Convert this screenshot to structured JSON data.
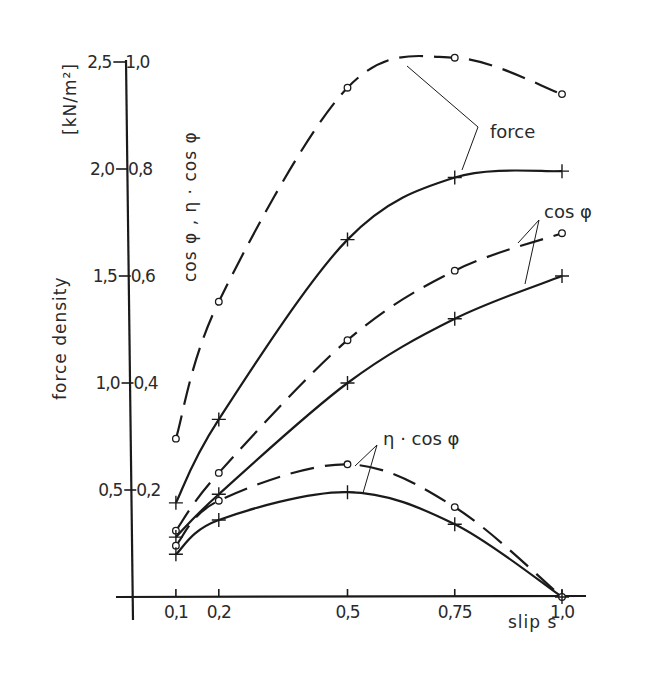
{
  "chart_data": {
    "type": "line",
    "title": "",
    "xlabel": "slip s",
    "ylabel_left": "force density",
    "ylabel_left_unit": "[kN/m²]",
    "ylabel_right": "cos φ , η·cos φ",
    "xlim": [
      0,
      1.05
    ],
    "ylim_left": [
      0,
      2.5
    ],
    "ylim_right": [
      0,
      1.0
    ],
    "grid": false,
    "legend": "inline annotations",
    "x_ticks": [
      "0,1",
      "0,2",
      "0,5",
      "0,75",
      "1,0"
    ],
    "x_tick_values": [
      0.1,
      0.2,
      0.5,
      0.75,
      1.0
    ],
    "y_ticks_left": [
      "0,5",
      "1,0",
      "1,5",
      "2,0",
      "2,5"
    ],
    "y_ticks_left_values": [
      0.5,
      1.0,
      1.5,
      2.0,
      2.5
    ],
    "y_ticks_right": [
      "0,2",
      "0,4",
      "0,6",
      "0,8",
      "1,0"
    ],
    "x": [
      0.1,
      0.2,
      0.5,
      0.75,
      1.0
    ],
    "series": [
      {
        "name": "force (dashed, o)",
        "axis": "left",
        "style": "dashed",
        "marker": "o",
        "values": [
          0.74,
          1.38,
          2.38,
          2.52,
          2.35
        ]
      },
      {
        "name": "force (solid, +)",
        "axis": "left",
        "style": "solid",
        "marker": "+",
        "values": [
          0.44,
          0.83,
          1.67,
          1.96,
          1.99
        ]
      },
      {
        "name": "cos φ (dashed, o)",
        "axis": "right",
        "style": "dashed",
        "marker": "o",
        "values": [
          0.124,
          0.232,
          0.48,
          0.61,
          0.68
        ]
      },
      {
        "name": "cos φ (solid, +)",
        "axis": "right",
        "style": "solid",
        "marker": "+",
        "values": [
          0.112,
          0.192,
          0.4,
          0.52,
          0.6
        ]
      },
      {
        "name": "η·cos φ (dashed, o)",
        "axis": "right",
        "style": "dashed",
        "marker": "o",
        "values": [
          0.096,
          0.18,
          0.248,
          0.168,
          0.0
        ]
      },
      {
        "name": "η·cos φ (solid, +)",
        "axis": "right",
        "style": "solid",
        "marker": "+",
        "values": [
          0.08,
          0.144,
          0.196,
          0.136,
          0.0
        ]
      }
    ],
    "annotations": [
      {
        "text": "force",
        "targets": [
          "force (dashed, o)",
          "force (solid, +)"
        ]
      },
      {
        "text": "cos φ",
        "targets": [
          "cos φ (dashed, o)",
          "cos φ (solid, +)"
        ]
      },
      {
        "text": "η · cos φ",
        "targets": [
          "η·cos φ (dashed, o)",
          "η·cos φ (solid, +)"
        ]
      }
    ]
  },
  "labels": {
    "ylabel_left": "force density",
    "ylabel_unit": "[kN/m²]",
    "ylabel_right": "cos φ , η · cos φ",
    "xlabel": "slip  s",
    "annot_force": "force",
    "annot_cos": "cos φ",
    "annot_eta": "η · cos φ"
  }
}
